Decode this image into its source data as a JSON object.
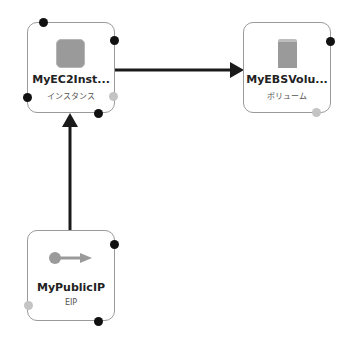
{
  "nodes": {
    "ec2": {
      "title": "MyEC2Inst...",
      "subtitle": "インスタンス",
      "icon": "ec2-instance-icon"
    },
    "ebs": {
      "title": "MyEBSVolu...",
      "subtitle": "ボリューム",
      "icon": "ebs-volume-icon"
    },
    "eip": {
      "title": "MyPublicIP",
      "subtitle": "EIP",
      "icon": "elastic-ip-icon"
    }
  },
  "edges": [
    {
      "from": "ec2",
      "to": "ebs"
    },
    {
      "from": "eip",
      "to": "ec2"
    }
  ],
  "colors": {
    "border": "#9a9a9a",
    "anchor_black": "#111111",
    "anchor_gray": "#c4c4c4",
    "edge": "#1a1a1a",
    "icon_fill": "#9a9a9a"
  }
}
